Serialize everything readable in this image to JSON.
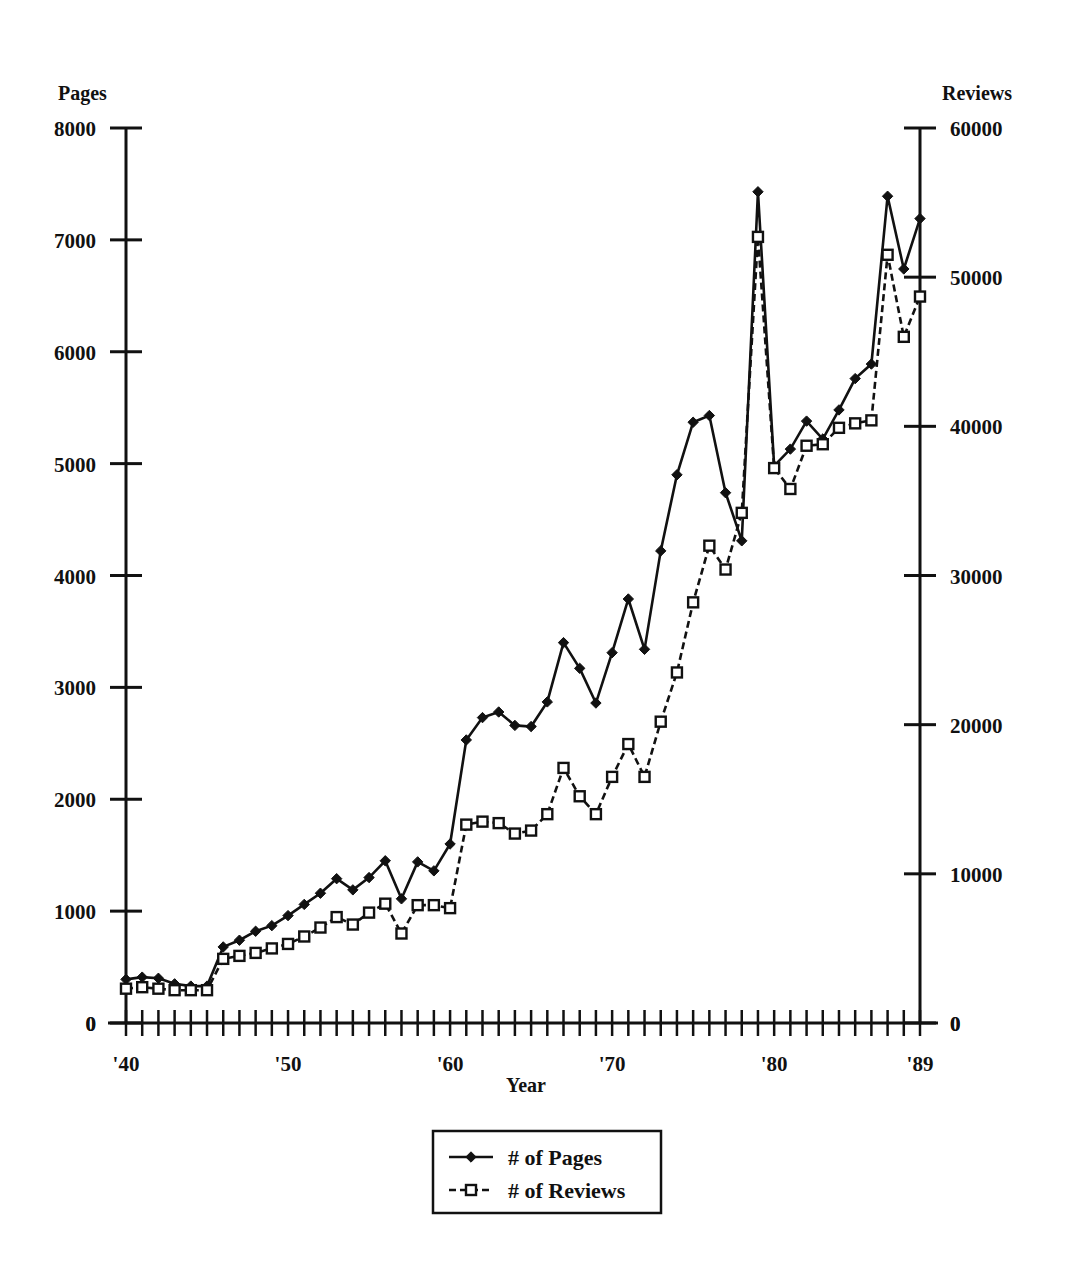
{
  "chart_data": {
    "type": "line",
    "title": "",
    "xlabel": "Year",
    "ylabel": "Pages",
    "y2label": "Reviews",
    "grid": false,
    "legend_position": "bottom-center",
    "xlim": [
      1940,
      1989
    ],
    "ylim": [
      0,
      8000
    ],
    "y2lim": [
      0,
      60000
    ],
    "x": [
      1940,
      1941,
      1942,
      1943,
      1944,
      1945,
      1946,
      1947,
      1948,
      1949,
      1950,
      1951,
      1952,
      1953,
      1954,
      1955,
      1956,
      1957,
      1958,
      1959,
      1960,
      1961,
      1962,
      1963,
      1964,
      1965,
      1966,
      1967,
      1968,
      1969,
      1970,
      1971,
      1972,
      1973,
      1974,
      1975,
      1976,
      1977,
      1978,
      1979,
      1980,
      1981,
      1982,
      1983,
      1984,
      1985,
      1986,
      1987,
      1988,
      1989
    ],
    "xticklabels": [
      "'40",
      "'50",
      "'60",
      "'70",
      "'80",
      "'89"
    ],
    "xtickvalues": [
      1940,
      1950,
      1960,
      1970,
      1980,
      1989
    ],
    "yticklabels": [
      "0",
      "1000",
      "2000",
      "3000",
      "4000",
      "5000",
      "6000",
      "7000",
      "8000"
    ],
    "ytickvalues": [
      0,
      1000,
      2000,
      3000,
      4000,
      5000,
      6000,
      7000,
      8000
    ],
    "y2ticklabels": [
      "0",
      "10000",
      "20000",
      "30000",
      "40000",
      "50000",
      "60000"
    ],
    "y2tickvalues": [
      0,
      10000,
      20000,
      30000,
      40000,
      50000,
      60000
    ],
    "series": [
      {
        "name": "# of Pages",
        "axis": "left",
        "marker": "filled-diamond",
        "linestyle": "solid",
        "values": [
          390,
          410,
          400,
          350,
          330,
          330,
          680,
          740,
          820,
          870,
          960,
          1060,
          1160,
          1290,
          1190,
          1300,
          1450,
          1110,
          1440,
          1360,
          1600,
          2530,
          2730,
          2780,
          2660,
          2650,
          2870,
          3400,
          3170,
          2860,
          3310,
          3790,
          3340,
          4220,
          4900,
          5370,
          5430,
          4740,
          4310,
          7430,
          4980,
          5130,
          5380,
          5220,
          5480,
          5760,
          5890,
          7390,
          6740,
          7190
        ]
      },
      {
        "name": "# of Reviews",
        "axis": "right",
        "marker": "open-square",
        "linestyle": "dashed",
        "values": [
          2300,
          2400,
          2300,
          2200,
          2200,
          2200,
          4300,
          4500,
          4700,
          5000,
          5300,
          5800,
          6400,
          7100,
          6600,
          7400,
          8000,
          6000,
          7900,
          7900,
          7700,
          13300,
          13500,
          13400,
          12700,
          12900,
          14000,
          17100,
          15200,
          14000,
          16500,
          18700,
          16500,
          20200,
          23500,
          28200,
          32000,
          30400,
          34200,
          52700,
          37200,
          35800,
          38700,
          38800,
          39900,
          40200,
          40400,
          51500,
          46000,
          48700
        ]
      }
    ]
  },
  "axes": {
    "left_title": "Pages",
    "right_title": "Reviews",
    "x_title": "Year"
  },
  "legend": {
    "entries": [
      {
        "label": "# of Pages",
        "marker": "filled-diamond",
        "style": "solid"
      },
      {
        "label": "# of Reviews",
        "marker": "open-square",
        "style": "dashed"
      }
    ]
  },
  "colors": {
    "ink": "#111111",
    "paper": "#ffffff"
  }
}
